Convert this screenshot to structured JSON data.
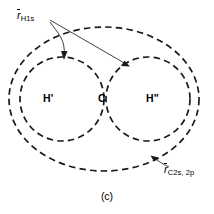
{
  "figure": {
    "caption": "(c)",
    "background_color": "#ffffff",
    "stroke_color": "#1a1a1a",
    "width": 214,
    "height": 214
  },
  "labels": {
    "h1s": {
      "symbol": "r",
      "subscript": "H1s",
      "overbar": true,
      "full_text": "r̄H1s"
    },
    "c2s2p": {
      "symbol": "r",
      "subscript": "C2s, 2p",
      "overbar": true,
      "full_text": "r̄C2s, 2p"
    }
  },
  "atoms": [
    {
      "name": "hydrogen-prime",
      "label": "H'",
      "position": "left"
    },
    {
      "name": "carbon",
      "label": "C",
      "position": "center"
    },
    {
      "name": "hydrogen-double-prime",
      "label": "H\"",
      "position": "right"
    }
  ],
  "shapes": {
    "carbon_envelope": {
      "name": "carbon-2s2p-envelope",
      "type": "ellipse",
      "cx": 104,
      "cy": 99,
      "rx": 95,
      "ry": 72,
      "dashed": true
    },
    "hydrogen_left": {
      "name": "hydrogen-prime-1s-circle",
      "type": "circle",
      "cx": 62,
      "cy": 99,
      "r": 42,
      "dashed": true
    },
    "hydrogen_right": {
      "name": "hydrogen-double-prime-1s-circle",
      "type": "circle",
      "cx": 148,
      "cy": 99,
      "r": 42,
      "dashed": true
    }
  },
  "leaders": [
    {
      "name": "leader-h1s-to-left-circle",
      "from": [
        50,
        22
      ],
      "to": [
        64,
        59
      ],
      "curved": true
    },
    {
      "name": "leader-h1s-to-right-circle",
      "from": [
        50,
        20
      ],
      "to": [
        129,
        66
      ],
      "curved": false
    },
    {
      "name": "leader-c2s2p-to-envelope",
      "from": [
        168,
        166
      ],
      "to": [
        152,
        156
      ],
      "curved": true
    }
  ]
}
